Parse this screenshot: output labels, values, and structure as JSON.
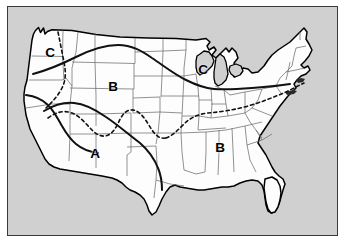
{
  "figure": {
    "kind": "map",
    "background_color": "#d0d0d0",
    "land_fill_color": "#fdfdfd",
    "outline_color": "#000000",
    "state_border_color": "#555555",
    "frame_color": "#3a3a3a"
  },
  "legend_keys": {
    "a_label": "A",
    "b_label": "B",
    "c_label": "C"
  },
  "zone_labels": [
    {
      "id": "zone-c-pacific-northwest",
      "text": "C",
      "x": 50,
      "y": 53,
      "region": "Pacific Northwest"
    },
    {
      "id": "zone-b-northern-rockies",
      "text": "B",
      "x": 113,
      "y": 87,
      "region": "Northern Rockies / Plains"
    },
    {
      "id": "zone-c-great-lakes",
      "text": "C",
      "x": 203,
      "y": 70,
      "region": "Upper Great Lakes"
    },
    {
      "id": "zone-a-southwest",
      "text": "A",
      "x": 95,
      "y": 154,
      "region": "Desert Southwest"
    },
    {
      "id": "zone-b-southeast",
      "text": "B",
      "x": 220,
      "y": 148,
      "region": "Deep South"
    }
  ],
  "boundaries": {
    "solid_line_label": "solid climate boundary",
    "dashed_line_label": "dashed climate boundary"
  }
}
